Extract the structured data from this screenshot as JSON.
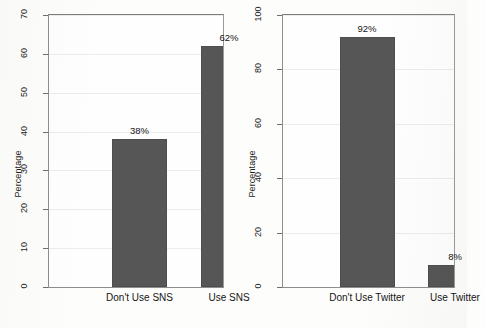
{
  "chart_data": [
    {
      "type": "bar",
      "title": "",
      "xlabel": "",
      "ylabel": "Percentage",
      "categories": [
        "Don't Use SNS",
        "Use SNS"
      ],
      "values": [
        38,
        62
      ],
      "value_labels": [
        "38%",
        "62%"
      ],
      "ylim": [
        0,
        70
      ],
      "yticks": [
        0,
        10,
        20,
        30,
        40,
        50,
        60,
        70
      ],
      "ytick_labels": [
        "0",
        "10",
        "20",
        "30",
        "40",
        "50",
        "60",
        "70"
      ],
      "grid": true,
      "legend": "none",
      "bar_color": "#565656",
      "panel": "left"
    },
    {
      "type": "bar",
      "title": "",
      "xlabel": "",
      "ylabel": "Percentage",
      "categories": [
        "Don't Use Twitter",
        "Use Twitter"
      ],
      "values": [
        92,
        8
      ],
      "value_labels": [
        "92%",
        "8%"
      ],
      "ylim": [
        0,
        100
      ],
      "yticks": [
        0,
        20,
        40,
        60,
        80,
        100
      ],
      "ytick_labels": [
        "0",
        "20",
        "40",
        "60",
        "80",
        "100"
      ],
      "grid": true,
      "legend": "none",
      "bar_color": "#565656",
      "panel": "right"
    }
  ],
  "colors": {
    "bar_fill": "#565656",
    "bar_edge": "#4e4e4e",
    "frame": "#8d8d8d",
    "gridline": "#ececec",
    "background": "#fdfdfb",
    "text": "#151515"
  }
}
